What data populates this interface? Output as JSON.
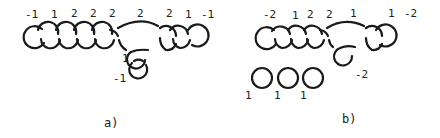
{
  "figure": {
    "panels": [
      {
        "id": "a",
        "caption": "a)",
        "chain_labels": [
          "-1",
          "1",
          "2",
          "2",
          "2",
          "2",
          "2",
          "1",
          "-1"
        ],
        "pendant_labels": [
          "1",
          "-1"
        ]
      },
      {
        "id": "b",
        "caption": "b)",
        "chain_labels": [
          "-2",
          "1",
          "2",
          "2",
          "1",
          "1",
          "-2"
        ],
        "pendant_labels": [
          "-2"
        ],
        "separate_circle_labels": [
          "1",
          "1",
          "1"
        ]
      }
    ],
    "colors": {
      "stroke": "#1a1a1a",
      "background": "#ffffff"
    }
  }
}
